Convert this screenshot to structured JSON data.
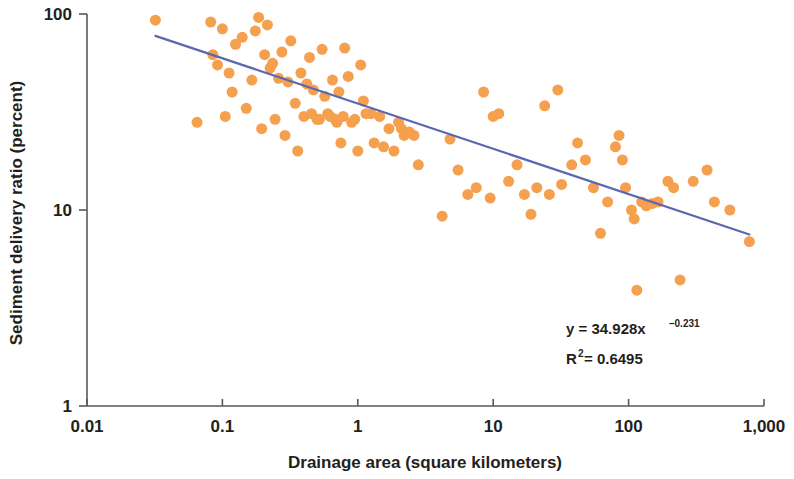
{
  "chart_data": {
    "type": "scatter",
    "title": "",
    "xlabel": "Drainage area (square kilometers)",
    "ylabel": "Sediment delivery ratio (percent)",
    "xscale": "log",
    "yscale": "log",
    "xlim": [
      0.01,
      1000
    ],
    "ylim": [
      1,
      100
    ],
    "grid": false,
    "legend": null,
    "xticks": [
      "0.01",
      "0.1",
      "1",
      "10",
      "100",
      "1,000"
    ],
    "xtick_values": [
      0.01,
      0.1,
      1,
      10,
      100,
      1000
    ],
    "yticks": [
      "1",
      "10",
      "100"
    ],
    "ytick_values": [
      1,
      10,
      100
    ],
    "marker": {
      "color": "#F5A04E",
      "shape": "circle",
      "size_px": 11
    },
    "series": [
      {
        "name": "Sediment delivery ratio observations",
        "points": [
          [
            0.032,
            93.0
          ],
          [
            0.065,
            28.0
          ],
          [
            0.082,
            91.0
          ],
          [
            0.085,
            62.0
          ],
          [
            0.092,
            55.0
          ],
          [
            0.1,
            84.0
          ],
          [
            0.105,
            30.0
          ],
          [
            0.112,
            50.0
          ],
          [
            0.118,
            40.0
          ],
          [
            0.125,
            70.0
          ],
          [
            0.14,
            76.0
          ],
          [
            0.15,
            33.0
          ],
          [
            0.165,
            46.0
          ],
          [
            0.175,
            82.0
          ],
          [
            0.185,
            96.0
          ],
          [
            0.195,
            26.0
          ],
          [
            0.205,
            62.0
          ],
          [
            0.215,
            88.0
          ],
          [
            0.225,
            53.0
          ],
          [
            0.235,
            56.0
          ],
          [
            0.245,
            29.0
          ],
          [
            0.26,
            47.0
          ],
          [
            0.275,
            64.0
          ],
          [
            0.29,
            24.0
          ],
          [
            0.305,
            45.0
          ],
          [
            0.32,
            73.0
          ],
          [
            0.345,
            35.0
          ],
          [
            0.36,
            20.0
          ],
          [
            0.38,
            50.0
          ],
          [
            0.4,
            30.0
          ],
          [
            0.42,
            44.0
          ],
          [
            0.44,
            60.0
          ],
          [
            0.455,
            31.0
          ],
          [
            0.47,
            41.0
          ],
          [
            0.5,
            29.0
          ],
          [
            0.52,
            29.0
          ],
          [
            0.545,
            66.0
          ],
          [
            0.57,
            38.0
          ],
          [
            0.6,
            31.0
          ],
          [
            0.625,
            30.0
          ],
          [
            0.65,
            46.0
          ],
          [
            0.68,
            29.0
          ],
          [
            0.7,
            28.0
          ],
          [
            0.725,
            40.0
          ],
          [
            0.75,
            22.0
          ],
          [
            0.78,
            30.0
          ],
          [
            0.8,
            67.0
          ],
          [
            0.85,
            48.0
          ],
          [
            0.9,
            28.0
          ],
          [
            0.95,
            29.0
          ],
          [
            1.0,
            20.0
          ],
          [
            1.05,
            55.0
          ],
          [
            1.1,
            36.0
          ],
          [
            1.15,
            31.0
          ],
          [
            1.25,
            31.0
          ],
          [
            1.32,
            22.0
          ],
          [
            1.45,
            30.0
          ],
          [
            1.55,
            21.0
          ],
          [
            1.7,
            26.0
          ],
          [
            1.85,
            20.0
          ],
          [
            2.0,
            28.0
          ],
          [
            2.1,
            26.0
          ],
          [
            2.2,
            24.0
          ],
          [
            2.4,
            25.0
          ],
          [
            2.6,
            24.0
          ],
          [
            2.8,
            17.0
          ],
          [
            4.2,
            9.3
          ],
          [
            4.8,
            23.0
          ],
          [
            5.5,
            16.0
          ],
          [
            6.5,
            12.0
          ],
          [
            7.5,
            13.0
          ],
          [
            8.5,
            40.0
          ],
          [
            9.5,
            11.5
          ],
          [
            10.0,
            30.0
          ],
          [
            11.0,
            31.0
          ],
          [
            13.0,
            14.0
          ],
          [
            15.0,
            17.0
          ],
          [
            17.0,
            12.0
          ],
          [
            19.0,
            9.5
          ],
          [
            21.0,
            13.0
          ],
          [
            24.0,
            34.0
          ],
          [
            26.0,
            12.0
          ],
          [
            30.0,
            41.0
          ],
          [
            32.0,
            13.5
          ],
          [
            38.0,
            17.0
          ],
          [
            42.0,
            22.0
          ],
          [
            48.0,
            18.0
          ],
          [
            55.0,
            13.0
          ],
          [
            62.0,
            7.6
          ],
          [
            70.0,
            11.0
          ],
          [
            80.0,
            21.0
          ],
          [
            85.0,
            24.0
          ],
          [
            90.0,
            18.0
          ],
          [
            95.0,
            13.0
          ],
          [
            105.0,
            10.0
          ],
          [
            110.0,
            9.0
          ],
          [
            115.0,
            3.9
          ],
          [
            125.0,
            11.0
          ],
          [
            135.0,
            10.5
          ],
          [
            150.0,
            10.8
          ],
          [
            165.0,
            11.0
          ],
          [
            195.0,
            14.0
          ],
          [
            215.0,
            13.0
          ],
          [
            240.0,
            4.4
          ],
          [
            300.0,
            14.0
          ],
          [
            380.0,
            16.0
          ],
          [
            430.0,
            11.0
          ],
          [
            560.0,
            10.0
          ],
          [
            780.0,
            6.9
          ]
        ]
      }
    ],
    "trendline": {
      "label": "power-law fit",
      "color": "#5B68B0",
      "equation": "y = 34.928x",
      "exponent": "–0.231",
      "r_squared_label": "R",
      "r_squared_sup": "2",
      "r_squared_value": "= 0.6495",
      "coefficient": 34.928,
      "power": -0.231,
      "r_squared": 0.6495,
      "x_start": 0.032,
      "x_end": 780
    },
    "annotations": [
      {
        "name": "equation",
        "line1": "y = 34.928x",
        "line1_sup": "–0.231",
        "line2": "R",
        "line2_sup": "2",
        "line2_rest": " = 0.6495"
      }
    ]
  },
  "axis": {
    "line_color": "#58595b",
    "x_label": "Drainage area (square kilometers)",
    "y_label": "Sediment delivery ratio (percent)"
  }
}
